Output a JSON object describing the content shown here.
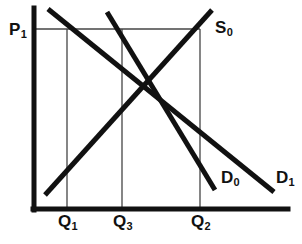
{
  "figure": {
    "kind": "supply-demand-diagram",
    "background_color": "#ffffff",
    "ink_color": "#111111",
    "guide_color": "#444444"
  },
  "chart_data": {
    "type": "line",
    "title": "",
    "xlabel": "",
    "ylabel": "",
    "xlim": [
      0,
      302
    ],
    "ylim": [
      244,
      0
    ],
    "grid": false,
    "legend": "inline-endpoint-labels",
    "axes": {
      "y_axis": {
        "name": "price-axis",
        "x": 34,
        "y_top": 8,
        "y_bottom": 210,
        "thickness": 5
      },
      "x_axis": {
        "name": "quantity-axis",
        "y": 209,
        "x_left": 33,
        "x_right": 288,
        "thickness": 5
      }
    },
    "series": [
      {
        "name": "S0",
        "label": "S",
        "sub": "0",
        "role": "supply",
        "points": [
          [
            45,
            195
          ],
          [
            212,
            10
          ]
        ],
        "slope": "upward",
        "label_position": [
          215,
          19
        ]
      },
      {
        "name": "D0",
        "label": "D",
        "sub": "0",
        "role": "demand-shifted-left",
        "points": [
          [
            107,
            12
          ],
          [
            215,
            190
          ]
        ],
        "slope": "downward",
        "label_position": [
          221,
          169
        ]
      },
      {
        "name": "D1",
        "label": "D",
        "sub": "1",
        "role": "demand-original",
        "points": [
          [
            48,
            9
          ],
          [
            274,
            192
          ]
        ],
        "slope": "downward",
        "label_position": [
          276,
          169
        ]
      }
    ],
    "price_levels": [
      {
        "name": "P1",
        "label": "P",
        "sub": "1",
        "y": 29,
        "x_start": 36,
        "x_end": 200,
        "label_position": [
          9,
          21
        ]
      }
    ],
    "quantity_markers": [
      {
        "name": "Q1",
        "label": "Q",
        "sub": "1",
        "x": 67,
        "y_top": 29,
        "y_bottom": 209,
        "label_position": [
          58,
          213
        ]
      },
      {
        "name": "Q3",
        "label": "Q",
        "sub": "3",
        "x": 122,
        "y_top": 29,
        "y_bottom": 209,
        "label_position": [
          113,
          213
        ]
      },
      {
        "name": "Q2",
        "label": "Q",
        "sub": "2",
        "x": 200,
        "y_top": 29,
        "y_bottom": 209,
        "label_position": [
          191,
          213
        ]
      }
    ],
    "labels": {
      "price_1": {
        "text": "P",
        "sub": "1"
      },
      "supply_0": {
        "text": "S",
        "sub": "0"
      },
      "demand_0": {
        "text": "D",
        "sub": "0"
      },
      "demand_1": {
        "text": "D",
        "sub": "1"
      },
      "quantity_1": {
        "text": "Q",
        "sub": "1"
      },
      "quantity_3": {
        "text": "Q",
        "sub": "3"
      },
      "quantity_2": {
        "text": "Q",
        "sub": "2"
      }
    }
  }
}
